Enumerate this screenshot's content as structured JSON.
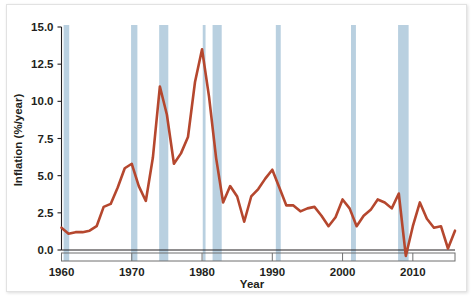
{
  "chart_data": {
    "type": "line",
    "title": "",
    "subtitle": "",
    "xlabel": "Year",
    "ylabel": "Inflation (%/year)",
    "xlim": [
      1960,
      2016
    ],
    "ylim": [
      -1.0,
      15.0
    ],
    "grid": false,
    "legend": "none",
    "line_color": "#b5472e",
    "band_color": "#b9d0e0",
    "axis_color": "#231f20",
    "background_color": "#ffffff",
    "xticks": [
      1960,
      1970,
      1980,
      1990,
      2000,
      2010
    ],
    "xtick_labels": [
      "1960",
      "1970",
      "1980",
      "1990",
      "2000",
      "2010"
    ],
    "yticks": [
      0.0,
      2.5,
      5.0,
      7.5,
      10.0,
      12.5,
      15.0
    ],
    "ytick_labels": [
      "0.0",
      "2.5",
      "5.0",
      "7.5",
      "10.0",
      "12.5",
      "15.0"
    ],
    "series": [
      {
        "name": "Inflation",
        "x": [
          1960,
          1961,
          1962,
          1963,
          1964,
          1965,
          1966,
          1967,
          1968,
          1969,
          1970,
          1971,
          1972,
          1973,
          1974,
          1975,
          1976,
          1977,
          1978,
          1979,
          1980,
          1981,
          1982,
          1983,
          1984,
          1985,
          1986,
          1987,
          1988,
          1989,
          1990,
          1991,
          1992,
          1993,
          1994,
          1995,
          1996,
          1997,
          1998,
          1999,
          2000,
          2001,
          2002,
          2003,
          2004,
          2005,
          2006,
          2007,
          2008,
          2009,
          2010,
          2011,
          2012,
          2013,
          2014,
          2015,
          2016
        ],
        "values": [
          1.5,
          1.1,
          1.2,
          1.2,
          1.3,
          1.6,
          2.9,
          3.1,
          4.2,
          5.5,
          5.8,
          4.3,
          3.3,
          6.2,
          11.0,
          9.1,
          5.8,
          6.5,
          7.6,
          11.3,
          13.5,
          10.3,
          6.2,
          3.2,
          4.3,
          3.6,
          1.9,
          3.6,
          4.1,
          4.8,
          5.4,
          4.2,
          3.0,
          3.0,
          2.6,
          2.8,
          2.9,
          2.3,
          1.6,
          2.2,
          3.4,
          2.8,
          1.6,
          2.3,
          2.7,
          3.4,
          3.2,
          2.8,
          3.8,
          -0.4,
          1.6,
          3.2,
          2.1,
          1.5,
          1.6,
          0.1,
          1.3
        ]
      }
    ],
    "recession_bands": [
      {
        "start": 1960.3,
        "end": 1961.1
      },
      {
        "start": 1969.9,
        "end": 1970.8
      },
      {
        "start": 1973.9,
        "end": 1975.2
      },
      {
        "start": 1980.1,
        "end": 1980.5
      },
      {
        "start": 1981.5,
        "end": 1982.8
      },
      {
        "start": 1990.5,
        "end": 1991.2
      },
      {
        "start": 2001.2,
        "end": 2001.9
      },
      {
        "start": 2007.9,
        "end": 2009.4
      }
    ]
  },
  "axis": {
    "y_title": "Inflation (%/year)",
    "x_title": "Year"
  }
}
